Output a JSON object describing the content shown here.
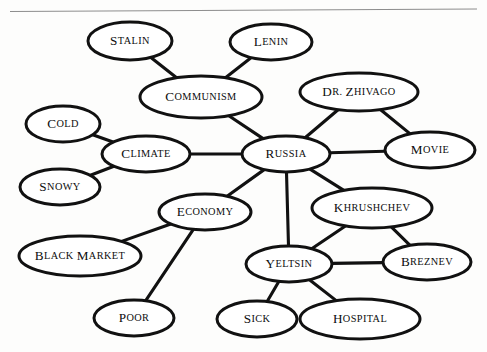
{
  "figure": {
    "type": "concept-map",
    "width": 487,
    "height": 352,
    "background_color": "#fdfdfc",
    "node_fill_color": "#ffffff",
    "node_stroke_color": "#111111",
    "edge_color": "#111111",
    "rule_color": "#8d8d8d",
    "text_color": "#0d0d0d",
    "text_style": "small-caps"
  },
  "top_rule": {
    "x1": 10,
    "y1": 11.5,
    "x2": 477,
    "y2": 9.0
  },
  "nodes": [
    {
      "id": "stalin",
      "label": "Stalin",
      "cx": 130,
      "cy": 41,
      "rx": 42,
      "ry": 19
    },
    {
      "id": "lenin",
      "label": "Lenin",
      "cx": 271,
      "cy": 42,
      "rx": 41,
      "ry": 18
    },
    {
      "id": "communism",
      "label": "Communism",
      "cx": 201,
      "cy": 97,
      "rx": 61,
      "ry": 21
    },
    {
      "id": "dr-zhivago",
      "label": "Dr. Zhivago",
      "cx": 359,
      "cy": 92,
      "rx": 59,
      "ry": 19
    },
    {
      "id": "cold",
      "label": "Cold",
      "cx": 63,
      "cy": 124,
      "rx": 37,
      "ry": 18
    },
    {
      "id": "climate",
      "label": "Climate",
      "cx": 146,
      "cy": 154,
      "rx": 44,
      "ry": 18
    },
    {
      "id": "russia",
      "label": "Russia",
      "cx": 286,
      "cy": 154,
      "rx": 44,
      "ry": 18
    },
    {
      "id": "movie",
      "label": "Movie",
      "cx": 430,
      "cy": 150,
      "rx": 45,
      "ry": 18
    },
    {
      "id": "snowy",
      "label": "Snowy",
      "cx": 60,
      "cy": 187,
      "rx": 40,
      "ry": 18
    },
    {
      "id": "economy",
      "label": "Economy",
      "cx": 205,
      "cy": 212,
      "rx": 46,
      "ry": 18
    },
    {
      "id": "khrushchev",
      "label": "Khrushchev",
      "cx": 372,
      "cy": 208,
      "rx": 60,
      "ry": 20
    },
    {
      "id": "black-market",
      "label": "Black Market",
      "cx": 80,
      "cy": 256,
      "rx": 61,
      "ry": 20
    },
    {
      "id": "yeltsin",
      "label": "Yeltsin",
      "cx": 289,
      "cy": 264,
      "rx": 43,
      "ry": 18
    },
    {
      "id": "breznev",
      "label": "Breznev",
      "cx": 427,
      "cy": 262,
      "rx": 44,
      "ry": 18
    },
    {
      "id": "poor",
      "label": "Poor",
      "cx": 134,
      "cy": 318,
      "rx": 40,
      "ry": 18
    },
    {
      "id": "sick",
      "label": "Sick",
      "cx": 257,
      "cy": 319,
      "rx": 40,
      "ry": 18
    },
    {
      "id": "hospital",
      "label": "Hospital",
      "cx": 360,
      "cy": 319,
      "rx": 60,
      "ry": 20
    }
  ],
  "edges": [
    {
      "from": "stalin",
      "to": "communism"
    },
    {
      "from": "lenin",
      "to": "communism"
    },
    {
      "from": "communism",
      "to": "russia"
    },
    {
      "from": "cold",
      "to": "climate"
    },
    {
      "from": "snowy",
      "to": "climate"
    },
    {
      "from": "climate",
      "to": "russia"
    },
    {
      "from": "russia",
      "to": "dr-zhivago"
    },
    {
      "from": "dr-zhivago",
      "to": "movie"
    },
    {
      "from": "russia",
      "to": "movie"
    },
    {
      "from": "russia",
      "to": "economy"
    },
    {
      "from": "russia",
      "to": "yeltsin"
    },
    {
      "from": "russia",
      "to": "khrushchev"
    },
    {
      "from": "economy",
      "to": "black-market"
    },
    {
      "from": "economy",
      "to": "poor"
    },
    {
      "from": "khrushchev",
      "to": "yeltsin"
    },
    {
      "from": "khrushchev",
      "to": "breznev"
    },
    {
      "from": "yeltsin",
      "to": "breznev"
    },
    {
      "from": "yeltsin",
      "to": "sick"
    },
    {
      "from": "yeltsin",
      "to": "hospital"
    }
  ]
}
